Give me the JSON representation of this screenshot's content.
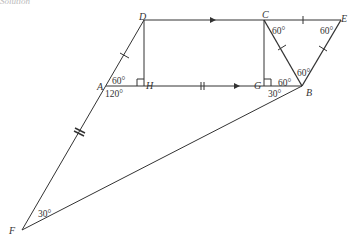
{
  "caption": "Solution",
  "colors": {
    "line": "#333333",
    "text": "#333333",
    "background": "#ffffff"
  },
  "points": {
    "A": {
      "label": "A",
      "x": 106,
      "y": 86
    },
    "B": {
      "label": "B",
      "x": 302,
      "y": 86
    },
    "C": {
      "label": "C",
      "x": 264,
      "y": 20
    },
    "D": {
      "label": "D",
      "x": 144,
      "y": 20
    },
    "E": {
      "label": "E",
      "x": 341,
      "y": 20
    },
    "F": {
      "label": "F",
      "x": 22,
      "y": 230
    },
    "G": {
      "label": "G",
      "x": 264,
      "y": 86
    },
    "H": {
      "label": "H",
      "x": 144,
      "y": 86
    }
  },
  "angles": {
    "A_upper": "60°",
    "A_lower": "120°",
    "C": "60°",
    "E": "60°",
    "B_top": "60°",
    "B_mid": "60°",
    "B_lower": "30°",
    "F": "30°"
  },
  "segments": [
    {
      "from": "D",
      "to": "E",
      "mark": "arrow-DC, tick-CE"
    },
    {
      "from": "A",
      "to": "B",
      "mark": "double-tick, arrow-HG"
    },
    {
      "from": "D",
      "to": "F",
      "mark": "tick-AD, double-tick-AF"
    },
    {
      "from": "D",
      "to": "H",
      "mark": "right-angle-H"
    },
    {
      "from": "C",
      "to": "G",
      "mark": "right-angle-G"
    },
    {
      "from": "C",
      "to": "B",
      "mark": "tick"
    },
    {
      "from": "E",
      "to": "B",
      "mark": "tick"
    },
    {
      "from": "F",
      "to": "B",
      "mark": ""
    }
  ]
}
